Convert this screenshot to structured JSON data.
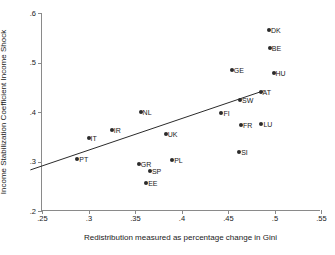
{
  "chart_data": {
    "type": "scatter",
    "title": "",
    "xlabel": "Redistribution measured as percentage change in Gini",
    "ylabel": "Income Stabilization Coefficient Income Shock",
    "xlim": [
      0.25,
      0.55
    ],
    "ylim": [
      0.2,
      0.6
    ],
    "xticks": [
      ".25",
      ".3",
      ".35",
      ".4",
      ".45",
      ".5",
      ".55"
    ],
    "xtick_values": [
      0.25,
      0.3,
      0.35,
      0.4,
      0.45,
      0.5,
      0.55
    ],
    "yticks": [
      ".2",
      ".3",
      ".4",
      ".5",
      ".6"
    ],
    "ytick_values": [
      0.2,
      0.3,
      0.4,
      0.5,
      0.6
    ],
    "grid": false,
    "legend": false,
    "marker": "filled-circle",
    "marker_color": "#2b2b2b",
    "line_color": "#2b2b2b",
    "points": [
      {
        "label": "PT",
        "x": 0.288,
        "y": 0.305
      },
      {
        "label": "IT",
        "x": 0.3,
        "y": 0.347
      },
      {
        "label": "IR",
        "x": 0.325,
        "y": 0.363
      },
      {
        "label": "GR",
        "x": 0.354,
        "y": 0.294
      },
      {
        "label": "NL",
        "x": 0.356,
        "y": 0.399
      },
      {
        "label": "EE",
        "x": 0.362,
        "y": 0.256
      },
      {
        "label": "SP",
        "x": 0.366,
        "y": 0.28
      },
      {
        "label": "UK",
        "x": 0.383,
        "y": 0.355
      },
      {
        "label": "PL",
        "x": 0.39,
        "y": 0.304
      },
      {
        "label": "FI",
        "x": 0.443,
        "y": 0.398
      },
      {
        "label": "GE",
        "x": 0.454,
        "y": 0.484
      },
      {
        "label": "SI",
        "x": 0.462,
        "y": 0.32
      },
      {
        "label": "SW",
        "x": 0.463,
        "y": 0.424
      },
      {
        "label": "FR",
        "x": 0.464,
        "y": 0.374
      },
      {
        "label": "AT",
        "x": 0.485,
        "y": 0.441
      },
      {
        "label": "LU",
        "x": 0.486,
        "y": 0.376
      },
      {
        "label": "DK",
        "x": 0.494,
        "y": 0.565
      },
      {
        "label": "BE",
        "x": 0.495,
        "y": 0.529
      },
      {
        "label": "HU",
        "x": 0.499,
        "y": 0.479
      }
    ],
    "fit_line": {
      "name": "linear-fit",
      "x0": 0.2375,
      "y0": 0.283,
      "x1": 0.4885,
      "y1": 0.443
    }
  }
}
